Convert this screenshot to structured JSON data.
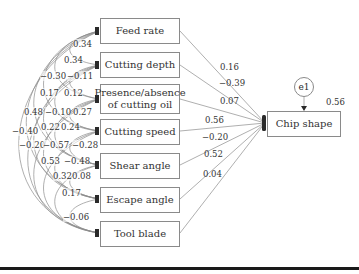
{
  "diagram": {
    "type": "path-diagram",
    "predictors": [
      {
        "label": "Feed rate",
        "path_coef": "0.16"
      },
      {
        "label": "Cutting depth",
        "path_coef": "−0.39"
      },
      {
        "label": "Presence/absence of cutting oil",
        "label_line1": "Presence/absence",
        "label_line2": "of cutting oil",
        "path_coef": "0.07"
      },
      {
        "label": "Cutting speed",
        "path_coef": "0.56"
      },
      {
        "label": "Shear angle",
        "path_coef": "−0.20"
      },
      {
        "label": "Escape angle",
        "path_coef": "0.52"
      },
      {
        "label": "Tool blade",
        "path_coef": "0.04"
      }
    ],
    "outcome": {
      "label": "Chip shape",
      "r_squared": "0.56"
    },
    "error_term": {
      "label": "e1"
    },
    "correlations": [
      {
        "label": "0.34",
        "x": 73,
        "y": 44
      },
      {
        "label": "0.34",
        "x": 64,
        "y": 60
      },
      {
        "label": "−0.30",
        "x": 40,
        "y": 76
      },
      {
        "label": "−0.11",
        "x": 67,
        "y": 76
      },
      {
        "label": "0.17",
        "x": 40,
        "y": 93
      },
      {
        "label": "0.12",
        "x": 64,
        "y": 93
      },
      {
        "label": "0.48",
        "x": 24,
        "y": 112
      },
      {
        "label": "−0.10",
        "x": 45,
        "y": 112
      },
      {
        "label": "0.27",
        "x": 73,
        "y": 112
      },
      {
        "label": "−0.40",
        "x": 12,
        "y": 131
      },
      {
        "label": "0.22",
        "x": 41,
        "y": 127
      },
      {
        "label": "0.24",
        "x": 61,
        "y": 127
      },
      {
        "label": "−0.20",
        "x": 19,
        "y": 145
      },
      {
        "label": "−0.57",
        "x": 43,
        "y": 145
      },
      {
        "label": "−0.28",
        "x": 72,
        "y": 145
      },
      {
        "label": "0.53",
        "x": 41,
        "y": 161
      },
      {
        "label": "−0.48",
        "x": 64,
        "y": 161
      },
      {
        "label": "0.32",
        "x": 53,
        "y": 176
      },
      {
        "label": "0.08",
        "x": 72,
        "y": 176
      },
      {
        "label": "0.17",
        "x": 62,
        "y": 193
      },
      {
        "label": "−0.06",
        "x": 63,
        "y": 217
      }
    ]
  }
}
